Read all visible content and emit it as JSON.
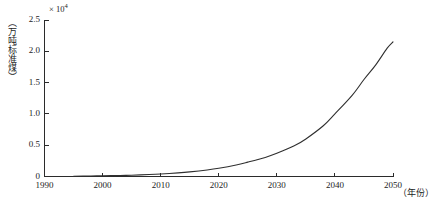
{
  "chart_data": {
    "type": "line",
    "title": "",
    "subtitle": "",
    "xlabel": "（年份）",
    "ylabel": "（万吨标准煤）",
    "y_exponent_label": "× 10",
    "y_exponent_power": "4",
    "xlim": [
      1990,
      2050
    ],
    "ylim": [
      0,
      2.5
    ],
    "grid": false,
    "legend": null,
    "xticks": [
      1990,
      2000,
      2010,
      2020,
      2030,
      2040,
      2050
    ],
    "xtick_labels": [
      "1990",
      "2000",
      "2010",
      "2020",
      "2030",
      "2040",
      "2050"
    ],
    "yticks": [
      0,
      0.5,
      1.0,
      1.5,
      2.0,
      2.5
    ],
    "ytick_labels": [
      "0",
      "0.5",
      "1.0",
      "1.5",
      "2.0",
      "2.5"
    ],
    "series": [
      {
        "name": "能源消费量",
        "color": "#2f2f2f",
        "x": [
          1995,
          1998,
          2000,
          2003,
          2005,
          2008,
          2010,
          2013,
          2015,
          2018,
          2020,
          2023,
          2025,
          2028,
          2030,
          2033,
          2035,
          2038,
          2040,
          2043,
          2045,
          2047,
          2049,
          2050
        ],
        "values": [
          0.005,
          0.008,
          0.011,
          0.016,
          0.021,
          0.031,
          0.04,
          0.058,
          0.074,
          0.105,
          0.132,
          0.185,
          0.23,
          0.305,
          0.37,
          0.49,
          0.6,
          0.81,
          1.0,
          1.3,
          1.55,
          1.78,
          2.05,
          2.15
        ]
      }
    ]
  },
  "axes": {
    "x_axis_name": "year-axis",
    "y_axis_name": "energy-axis"
  }
}
